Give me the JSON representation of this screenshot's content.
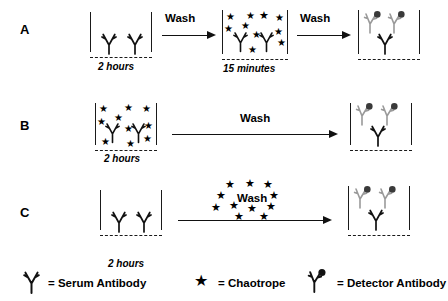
{
  "figure": {
    "rows": [
      {
        "letter": "A",
        "steps": [
          {
            "kind": "well",
            "time_label": "2 hours",
            "contents": "two serum antibodies"
          },
          {
            "kind": "arrow",
            "label": "Wash"
          },
          {
            "kind": "well",
            "time_label": "15 minutes",
            "contents": "two serum antibodies with chaotrope stars"
          },
          {
            "kind": "arrow",
            "label": "Wash"
          },
          {
            "kind": "well",
            "time_label": "",
            "contents": "serum antibody with two detector antibodies"
          }
        ]
      },
      {
        "letter": "B",
        "steps": [
          {
            "kind": "well",
            "time_label": "2 hours",
            "contents": "two serum antibodies with chaotrope stars"
          },
          {
            "kind": "arrow",
            "label": "Wash"
          },
          {
            "kind": "well",
            "time_label": "",
            "contents": "serum antibody with two detector antibodies"
          }
        ]
      },
      {
        "letter": "C",
        "steps": [
          {
            "kind": "well",
            "time_label": "2 hours",
            "contents": "two serum antibodies"
          },
          {
            "kind": "arrow",
            "label": "Wash",
            "stars_overlay": true
          },
          {
            "kind": "well",
            "time_label": "",
            "contents": "serum antibody with two detector antibodies"
          }
        ]
      }
    ]
  },
  "legend": {
    "items": [
      {
        "icon": "serum-antibody-icon",
        "equals": "= Serum Antibody"
      },
      {
        "icon": "chaotrope-star-icon",
        "equals": "= Chaotrope"
      },
      {
        "icon": "detector-antibody-icon",
        "equals": "= Detector Antibody"
      }
    ]
  },
  "colors": {
    "ink": "#111111",
    "serum_antibody": "#111111",
    "detector_antibody_stem": "#9a9a9a",
    "detector_antibody_dot": "#3a3a3a",
    "chaotrope": "#000000",
    "background": "#ffffff"
  },
  "labels": {
    "row_a": "A",
    "row_b": "B",
    "row_c": "C",
    "wash": "Wash",
    "two_hours": "2 hours",
    "fifteen_minutes": "15 minutes",
    "serum_antibody": "= Serum Antibody",
    "chaotrope": "= Chaotrope",
    "detector_antibody": "= Detector Antibody"
  }
}
